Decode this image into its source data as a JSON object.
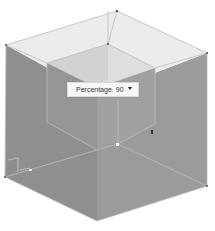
{
  "scene": {
    "type": "3d-modeling-viewport",
    "object": "hollow cube with inset opening",
    "colors": {
      "background": "#ffffff",
      "top_face": "#e9e9e9",
      "left_face": "#8e8e8e",
      "right_face": "#9a9a9a",
      "inner_floor": "#dcdcdc",
      "inner_back_left": "#cfcfcf",
      "inner_back_right": "#d9d9d9",
      "edge_line": "#b9b9b9",
      "vertex": "#555555"
    }
  },
  "measurement_box": {
    "label": "Percentage",
    "value": "90",
    "dropdown_icon": "caret-down"
  }
}
